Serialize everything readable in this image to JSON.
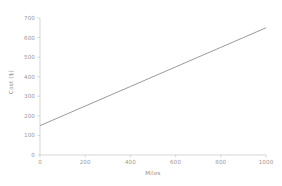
{
  "chart_data": {
    "type": "line",
    "title": "",
    "subtitle": "",
    "xlabel": "Miles",
    "ylabel": "Cost ($)",
    "xlim": [
      0,
      1000
    ],
    "ylim": [
      0,
      700
    ],
    "xticks": [
      0,
      200,
      400,
      600,
      800,
      1000
    ],
    "xtick_labels": [
      "0",
      "200",
      "400",
      "600",
      "800",
      "1000"
    ],
    "yticks": [
      0,
      100,
      200,
      300,
      400,
      500,
      600,
      700
    ],
    "ytick_labels": [
      "0",
      "100",
      "200",
      "300",
      "400",
      "500",
      "600",
      "700"
    ],
    "grid": false,
    "legend": null,
    "annotations": [],
    "series": [
      {
        "name": "cost",
        "x": [
          0,
          100,
          200,
          300,
          400,
          500,
          600,
          700,
          800,
          900,
          1000
        ],
        "values": [
          150,
          200,
          250,
          300,
          350,
          400,
          450,
          500,
          550,
          600,
          650
        ],
        "color": "#6e6e6e",
        "line_width": 0.7,
        "intercept": 150,
        "slope": 0.5
      }
    ]
  },
  "style": {
    "background": "#ffffff",
    "axis_color": "#c4c4c4",
    "tick_label_color": "#9a9a9a",
    "axis_label_color": "#8f8f8f",
    "line_color": "#6e6e6e"
  }
}
